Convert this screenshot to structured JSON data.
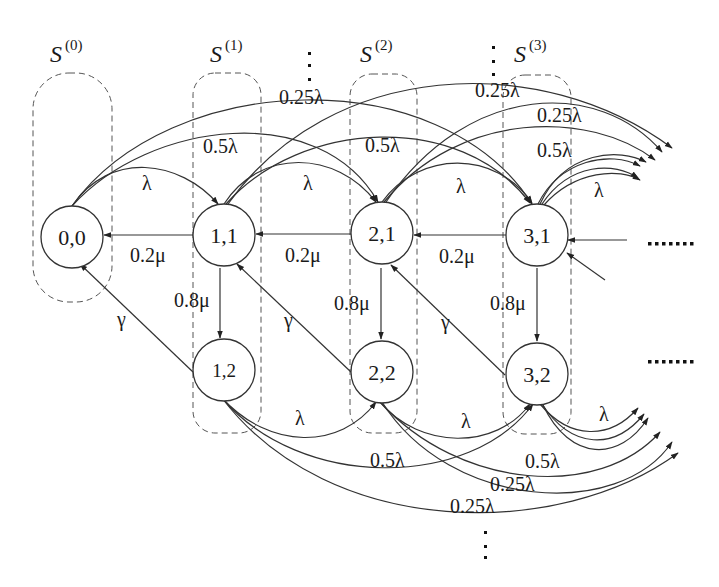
{
  "diagram": {
    "type": "state-transition-diagram",
    "groups": [
      {
        "id": "S0",
        "label": "S",
        "superscript": "(0)"
      },
      {
        "id": "S1",
        "label": "S",
        "superscript": "(1)"
      },
      {
        "id": "S2",
        "label": "S",
        "superscript": "(2)"
      },
      {
        "id": "S3",
        "label": "S",
        "superscript": "(3)"
      }
    ],
    "nodes": [
      {
        "id": "n00",
        "label": "0,0",
        "group": "S0"
      },
      {
        "id": "n11",
        "label": "1,1",
        "group": "S1"
      },
      {
        "id": "n12",
        "label": "1,2",
        "group": "S1"
      },
      {
        "id": "n21",
        "label": "2,1",
        "group": "S2"
      },
      {
        "id": "n22",
        "label": "2,2",
        "group": "S2"
      },
      {
        "id": "n31",
        "label": "3,1",
        "group": "S3"
      },
      {
        "id": "n32",
        "label": "3,2",
        "group": "S3"
      }
    ],
    "edge_labels": {
      "lambda": "λ",
      "half_lambda": "0.5λ",
      "quarter_lambda": "0.25λ",
      "mu_02": "0.2μ",
      "mu_08": "0.8μ",
      "gamma": "γ"
    },
    "edges": [
      {
        "from": "0,0",
        "to": "1,1",
        "label": "λ"
      },
      {
        "from": "0,0",
        "to": "2,1",
        "label": "0.5λ"
      },
      {
        "from": "0,0",
        "to": "3,1",
        "label": "0.25λ"
      },
      {
        "from": "1,1",
        "to": "2,1",
        "label": "λ"
      },
      {
        "from": "1,1",
        "to": "3,1",
        "label": "0.5λ"
      },
      {
        "from": "1,1",
        "to": "4,1",
        "label": "0.25λ"
      },
      {
        "from": "2,1",
        "to": "3,1",
        "label": "λ"
      },
      {
        "from": "2,1",
        "to": "4,1",
        "label": "0.5λ"
      },
      {
        "from": "2,1",
        "to": "5,1",
        "label": "0.25λ"
      },
      {
        "from": "3,1",
        "to": "4,1",
        "label": "λ"
      },
      {
        "from": "1,1",
        "to": "0,0",
        "label": "0.2μ"
      },
      {
        "from": "2,1",
        "to": "1,1",
        "label": "0.2μ"
      },
      {
        "from": "3,1",
        "to": "2,1",
        "label": "0.2μ"
      },
      {
        "from": "1,1",
        "to": "1,2",
        "label": "0.8μ"
      },
      {
        "from": "2,1",
        "to": "2,2",
        "label": "0.8μ"
      },
      {
        "from": "3,1",
        "to": "3,2",
        "label": "0.8μ"
      },
      {
        "from": "1,2",
        "to": "0,0",
        "label": "γ"
      },
      {
        "from": "2,2",
        "to": "1,1",
        "label": "γ"
      },
      {
        "from": "3,2",
        "to": "2,1",
        "label": "γ"
      },
      {
        "from": "1,2",
        "to": "2,2",
        "label": "λ"
      },
      {
        "from": "1,2",
        "to": "3,2",
        "label": "0.5λ"
      },
      {
        "from": "2,2",
        "to": "3,2",
        "label": "λ"
      },
      {
        "from": "3,2",
        "to": "4,2",
        "label": "λ"
      }
    ],
    "continuation_marks": {
      "horizontal_dots": "·······",
      "vertical_dots": "⋮"
    }
  }
}
